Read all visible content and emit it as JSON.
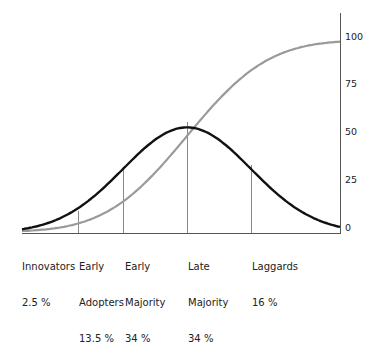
{
  "chart_data": {
    "type": "line",
    "title": "",
    "xlabel": "",
    "ylabel": "",
    "ylim": [
      0,
      100
    ],
    "yaxis_position": "right",
    "y_ticks": [
      0,
      25,
      50,
      75,
      100
    ],
    "grid": false,
    "series": [
      {
        "name": "Adoption rate (bell curve)",
        "color": "#111111",
        "shape": "normal distribution, peak at Late Majority boundary, peak value ~55"
      },
      {
        "name": "Cumulative adoption (S-curve)",
        "color": "#9a9a9a",
        "shape": "cumulative, 0 to 100"
      }
    ],
    "segments": [
      {
        "name": "Innovators",
        "share": "2.5 %"
      },
      {
        "name": "Early Adopters",
        "share": "13.5 %"
      },
      {
        "name": "Early Majority",
        "share": "34 %"
      },
      {
        "name": "Late Majority",
        "share": "34 %"
      },
      {
        "name": "Laggards",
        "share": "16 %"
      }
    ],
    "segment_boundaries_cumulative": [
      2.5,
      16,
      50,
      84,
      100
    ]
  },
  "labels": {
    "innovators": {
      "line1": "Innovators",
      "line2": "2.5 %"
    },
    "early_adopters": {
      "line1": "Early",
      "line2": "Adopters",
      "line3": "13.5 %"
    },
    "early_majority": {
      "line1": "Early",
      "line2": "Majority",
      "line3": "34 %"
    },
    "late_majority": {
      "line1": "Late",
      "line2": "Majority",
      "line3": "34 %"
    },
    "laggards": {
      "line1": "Laggards",
      "line2": "16 %"
    }
  },
  "yticks": {
    "t0": "0",
    "t25": "25",
    "t50": "50",
    "t75": "75",
    "t100": "100"
  },
  "colors": {
    "bell": "#111111",
    "scurve": "#9a9a9a",
    "divider": "#8a8a8a",
    "axis": "#555555"
  }
}
